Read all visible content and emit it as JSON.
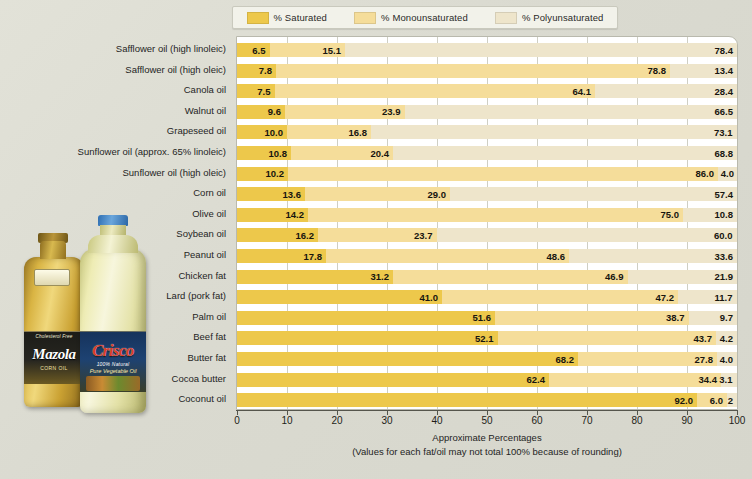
{
  "legend": {
    "items": [
      {
        "label": "% Saturated",
        "color": "#edc84b",
        "icon": "legend-swatch"
      },
      {
        "label": "% Monounsaturated",
        "color": "#f5dd9a",
        "icon": "legend-swatch"
      },
      {
        "label": "% Polyunsaturated",
        "color": "#eee5cb",
        "icon": "legend-swatch"
      }
    ]
  },
  "axis": {
    "caption_line1": "Approximate Percentages",
    "caption_line2": "(Values for each fat/oil may not total 100% because of rounding)",
    "ticks": [
      "0",
      "10",
      "20",
      "30",
      "40",
      "50",
      "60",
      "70",
      "80",
      "90",
      "100"
    ]
  },
  "photo": {
    "bottle_left": {
      "brand": "Mazola",
      "subtitle": "CORN OIL",
      "tagline": "Cholesterol Free",
      "seal": "Heart Healthy"
    },
    "bottle_right": {
      "brand": "Crisco",
      "subtitle": "100% Natural",
      "subtitle2": "Pure Vegetable Oil"
    }
  },
  "chart_data": {
    "type": "bar",
    "orientation": "horizontal",
    "stacked": true,
    "title": "",
    "xlabel": "Approximate Percentages",
    "ylabel": "",
    "xlim": [
      0,
      100
    ],
    "xticks": [
      0,
      10,
      20,
      30,
      40,
      50,
      60,
      70,
      80,
      90,
      100
    ],
    "grid": "vertical",
    "legend_position": "top",
    "series": [
      {
        "name": "% Saturated",
        "color": "#edc84b",
        "values": [
          6.5,
          7.8,
          7.5,
          9.6,
          10.0,
          10.8,
          10.2,
          13.6,
          14.2,
          16.2,
          17.8,
          31.2,
          41.0,
          51.6,
          52.1,
          68.2,
          62.4,
          92.0
        ]
      },
      {
        "name": "% Monounsaturated",
        "color": "#f5dd9a",
        "values": [
          15.1,
          78.8,
          64.1,
          23.9,
          16.8,
          20.4,
          86.0,
          29.0,
          75.0,
          23.7,
          48.6,
          46.9,
          47.2,
          38.7,
          43.7,
          27.8,
          34.4,
          6.0
        ]
      },
      {
        "name": "% Polyunsaturated",
        "color": "#eee5cb",
        "values": [
          78.4,
          13.4,
          28.4,
          66.5,
          73.1,
          68.8,
          4.0,
          57.4,
          10.8,
          60.0,
          33.6,
          21.9,
          11.7,
          9.7,
          4.2,
          4.0,
          3.1,
          2.0
        ]
      }
    ],
    "categories": [
      "Safflower oil (high linoleic)",
      "Safflower oil (high oleic)",
      "Canola oil",
      "Walnut oil",
      "Grapeseed oil",
      "Sunflower oil (approx. 65% linoleic)",
      "Sunflower oil (high oleic)",
      "Corn oil",
      "Olive oil",
      "Soybean oil",
      "Peanut oil",
      "Chicken fat",
      "Lard (pork fat)",
      "Palm oil",
      "Beef fat",
      "Butter fat",
      "Cocoa butter",
      "Coconut oil"
    ],
    "value_labels": [
      [
        "6.5",
        "15.1",
        "78.4"
      ],
      [
        "7.8",
        "78.8",
        "13.4"
      ],
      [
        "7.5",
        "64.1",
        "28.4"
      ],
      [
        "9.6",
        "23.9",
        "66.5"
      ],
      [
        "10.0",
        "16.8",
        "73.1"
      ],
      [
        "10.8",
        "20.4",
        "68.8"
      ],
      [
        "10.2",
        "86.0",
        "4.0"
      ],
      [
        "13.6",
        "29.0",
        "57.4"
      ],
      [
        "14.2",
        "75.0",
        "10.8"
      ],
      [
        "16.2",
        "23.7",
        "60.0"
      ],
      [
        "17.8",
        "48.6",
        "33.6"
      ],
      [
        "31.2",
        "46.9",
        "21.9"
      ],
      [
        "41.0",
        "47.2",
        "11.7"
      ],
      [
        "51.6",
        "38.7",
        "9.7"
      ],
      [
        "52.1",
        "43.7",
        "4.2"
      ],
      [
        "68.2",
        "27.8",
        "4.0"
      ],
      [
        "62.4",
        "34.4",
        "3.1"
      ],
      [
        "92.0",
        "6.0",
        "2"
      ]
    ]
  }
}
